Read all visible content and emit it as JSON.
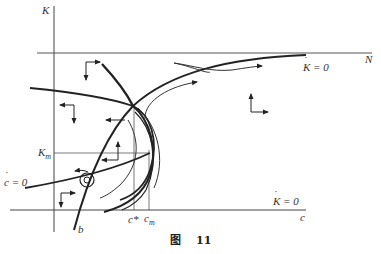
{
  "figure": {
    "caption_prefix": "图",
    "caption_number": "11",
    "labels": {
      "y_axis": "K",
      "x_axis": "c",
      "top_line": "N",
      "k_dot_zero_top": "K = 0",
      "k_dot_zero_bottom": "K = 0",
      "c_dot_zero": "c = 0",
      "k_m": "K",
      "k_m_sub": "m",
      "c_star": "c*",
      "c_m": "c",
      "c_m_sub": "m",
      "b": "b"
    },
    "colors": {
      "line": "#222222",
      "thin": "#555555",
      "background": "#ffffff"
    }
  }
}
